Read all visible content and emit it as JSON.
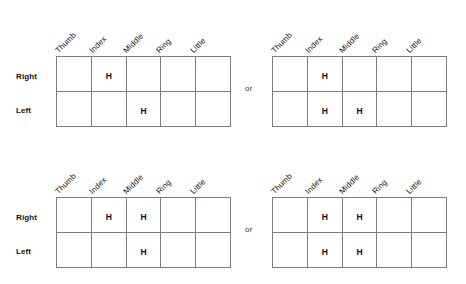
{
  "figure": {
    "conjunction_label": "or",
    "column_headers": [
      "Thumb",
      "Index",
      "Middle",
      "Ring",
      "Little"
    ],
    "row_labels": [
      "Right",
      "Left"
    ],
    "mark": "H",
    "colors": {
      "grid_line": "#7d7d7d",
      "text": "#111111",
      "background": "#ffffff"
    },
    "panels": [
      {
        "id": "top-left",
        "position": "top-left",
        "row_labels": [
          "Right",
          "Left"
        ],
        "column_headers": [
          "Thumb",
          "Index",
          "Middle",
          "Ring",
          "Little"
        ],
        "cells": [
          [
            "",
            "H",
            "",
            "",
            ""
          ],
          [
            "",
            "",
            "H",
            "",
            ""
          ]
        ]
      },
      {
        "id": "top-right",
        "position": "top-right",
        "row_labels": [
          "Right",
          "Left"
        ],
        "column_headers": [
          "Thumb",
          "Index",
          "Middle",
          "Ring",
          "Little"
        ],
        "cells": [
          [
            "",
            "H",
            "",
            "",
            ""
          ],
          [
            "",
            "H",
            "H",
            "",
            ""
          ]
        ]
      },
      {
        "id": "bottom-left",
        "position": "bottom-left",
        "row_labels": [
          "Right",
          "Left"
        ],
        "column_headers": [
          "Thumb",
          "Index",
          "Middle",
          "Ring",
          "Little"
        ],
        "cells": [
          [
            "",
            "H",
            "H",
            "",
            ""
          ],
          [
            "",
            "",
            "H",
            "",
            ""
          ]
        ]
      },
      {
        "id": "bottom-right",
        "position": "bottom-right",
        "row_labels": [
          "Right",
          "Left"
        ],
        "column_headers": [
          "Thumb",
          "Index",
          "Middle",
          "Ring",
          "Little"
        ],
        "cells": [
          [
            "",
            "H",
            "H",
            "",
            ""
          ],
          [
            "",
            "H",
            "H",
            "",
            ""
          ]
        ]
      }
    ]
  }
}
